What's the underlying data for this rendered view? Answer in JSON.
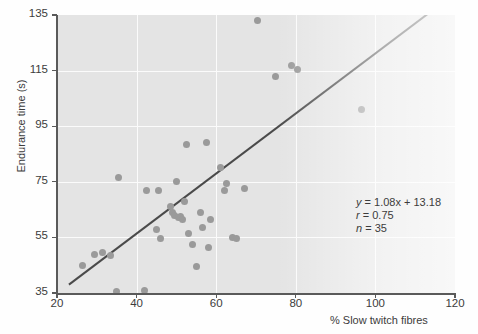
{
  "chart_data": {
    "type": "scatter",
    "title": "",
    "xlabel": "% Slow twitch fibres",
    "ylabel": "Endurance time (s)",
    "xlim": [
      20,
      120
    ],
    "ylim": [
      35,
      135
    ],
    "xticks": [
      20,
      40,
      60,
      80,
      100,
      120
    ],
    "yticks": [
      35,
      55,
      75,
      95,
      115,
      135
    ],
    "grid": true,
    "legend": "none",
    "point_color": "#9a9a9a",
    "line_color": "#4a4a4a",
    "panel_color": "#e4e4e4",
    "gridline_color": "#fbfbfb",
    "points": [
      {
        "x": 26.5,
        "y": 45.0
      },
      {
        "x": 29.5,
        "y": 49.0
      },
      {
        "x": 31.5,
        "y": 49.5
      },
      {
        "x": 33.5,
        "y": 48.5
      },
      {
        "x": 35.0,
        "y": 35.5
      },
      {
        "x": 35.5,
        "y": 76.5
      },
      {
        "x": 42.0,
        "y": 36.0
      },
      {
        "x": 42.5,
        "y": 72.0
      },
      {
        "x": 45.0,
        "y": 58.0
      },
      {
        "x": 45.5,
        "y": 72.0
      },
      {
        "x": 46.0,
        "y": 54.5
      },
      {
        "x": 48.5,
        "y": 66.0
      },
      {
        "x": 49.0,
        "y": 64.0
      },
      {
        "x": 49.5,
        "y": 63.0
      },
      {
        "x": 50.0,
        "y": 75.0
      },
      {
        "x": 50.5,
        "y": 62.0
      },
      {
        "x": 51.0,
        "y": 62.5
      },
      {
        "x": 51.5,
        "y": 61.5
      },
      {
        "x": 52.0,
        "y": 68.0
      },
      {
        "x": 52.5,
        "y": 88.5
      },
      {
        "x": 53.0,
        "y": 56.5
      },
      {
        "x": 54.0,
        "y": 52.5
      },
      {
        "x": 55.0,
        "y": 44.5
      },
      {
        "x": 56.0,
        "y": 64.0
      },
      {
        "x": 56.5,
        "y": 58.5
      },
      {
        "x": 57.5,
        "y": 89.0
      },
      {
        "x": 58.0,
        "y": 51.5
      },
      {
        "x": 58.5,
        "y": 61.5
      },
      {
        "x": 61.0,
        "y": 80.0
      },
      {
        "x": 62.0,
        "y": 72.0
      },
      {
        "x": 62.5,
        "y": 74.5
      },
      {
        "x": 64.0,
        "y": 55.0
      },
      {
        "x": 65.0,
        "y": 54.5
      },
      {
        "x": 67.0,
        "y": 72.5
      },
      {
        "x": 70.5,
        "y": 133.0
      },
      {
        "x": 75.0,
        "y": 113.0
      },
      {
        "x": 79.0,
        "y": 117.0
      },
      {
        "x": 80.5,
        "y": 115.5
      },
      {
        "x": 96.5,
        "y": 101.0
      }
    ],
    "fit_line": {
      "slope": 1.08,
      "intercept": 13.18,
      "x_start": 23.0,
      "x_end": 121.0
    },
    "annotation": {
      "equation_var": "y",
      "equation": "= 1.08x + 13.18",
      "r_var": "r",
      "r_value": "= 0.75",
      "n_var": "n",
      "n_value": "= 35"
    }
  }
}
